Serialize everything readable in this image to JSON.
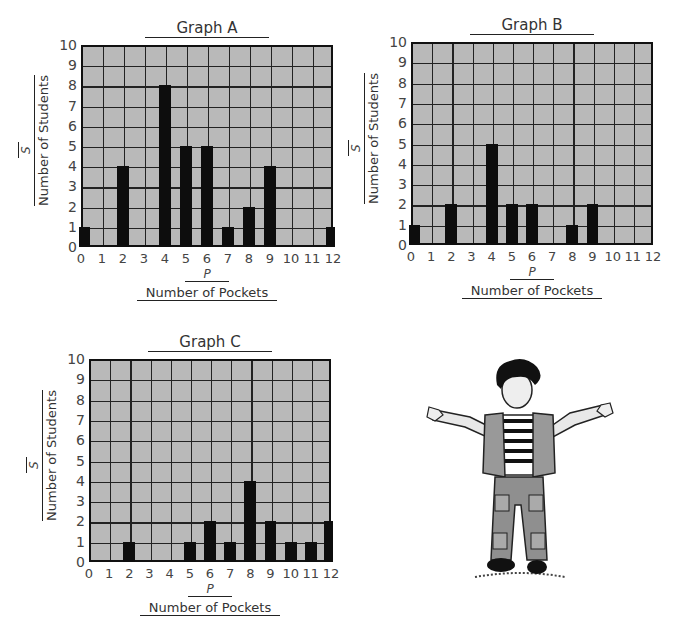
{
  "chart_data": [
    {
      "type": "bar",
      "title": "Graph A",
      "xlabel": "Number of Pockets",
      "xvar": "P",
      "ylabel": "Number of Students",
      "yvar": "S",
      "categories": [
        0,
        1,
        2,
        3,
        4,
        5,
        6,
        7,
        8,
        9,
        10,
        11,
        12
      ],
      "values": [
        1,
        0,
        4,
        0,
        8,
        5,
        5,
        1,
        2,
        4,
        0,
        0,
        1
      ],
      "ylim": [
        0,
        10
      ],
      "xlim": [
        0,
        12
      ],
      "grid": true,
      "legend": null
    },
    {
      "type": "bar",
      "title": "Graph B",
      "xlabel": "Number of Pockets",
      "xvar": "P",
      "ylabel": "Number of Students",
      "yvar": "S",
      "categories": [
        0,
        1,
        2,
        3,
        4,
        5,
        6,
        7,
        8,
        9,
        10,
        11,
        12
      ],
      "values": [
        1,
        0,
        2,
        0,
        5,
        2,
        2,
        0,
        1,
        2,
        0,
        0,
        0
      ],
      "ylim": [
        0,
        10
      ],
      "xlim": [
        0,
        12
      ],
      "grid": true,
      "legend": null
    },
    {
      "type": "bar",
      "title": "Graph C",
      "xlabel": "Number of Pockets",
      "xvar": "P",
      "ylabel": "Number of Students",
      "yvar": "S",
      "categories": [
        0,
        1,
        2,
        3,
        4,
        5,
        6,
        7,
        8,
        9,
        10,
        11,
        12
      ],
      "values": [
        0,
        0,
        1,
        0,
        0,
        1,
        2,
        1,
        4,
        2,
        1,
        1,
        2
      ],
      "ylim": [
        0,
        10
      ],
      "xlim": [
        0,
        12
      ],
      "grid": true,
      "legend": null
    }
  ],
  "colors": {
    "grid_fill": "#b9b9b9",
    "bar": "#0d0d0d",
    "line": "#222222"
  },
  "illustration": {
    "description": "cartoon boy with arms outstretched wearing vest and cargo pants"
  }
}
